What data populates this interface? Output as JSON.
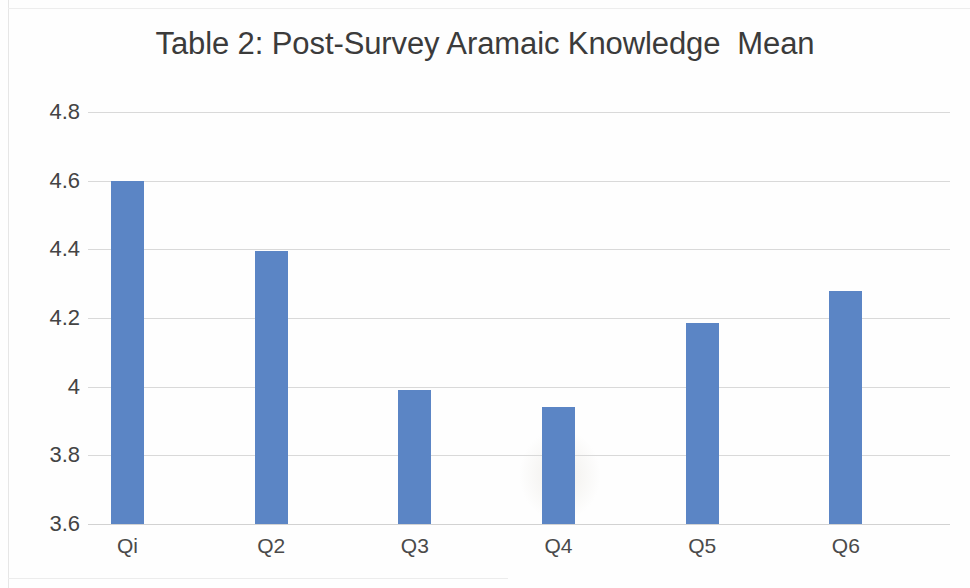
{
  "chart_data": {
    "type": "bar",
    "title": "Table 2: Post-Survey Aramaic Knowledge  Mean",
    "xlabel": "",
    "ylabel": "",
    "categories": [
      "Qi",
      "Q2",
      "Q3",
      "Q4",
      "Q5",
      "Q6"
    ],
    "values": [
      4.6,
      4.395,
      3.99,
      3.94,
      4.185,
      4.28
    ],
    "ylim": [
      3.6,
      4.8
    ],
    "ytick_labels": [
      "4.8",
      "4.6",
      "4.4",
      "4.2",
      "4",
      "3.8",
      "3.6"
    ],
    "ytick_values": [
      4.8,
      4.6,
      4.4,
      4.2,
      4.0,
      3.8,
      3.6
    ],
    "grid": true,
    "legend": false,
    "legend_position": "none",
    "series": [
      {
        "name": "Mean",
        "values": [
          4.6,
          4.395,
          3.99,
          3.94,
          4.185,
          4.28
        ]
      }
    ],
    "colors": {
      "bar": "#5b85c5",
      "gridline": "#d9d9d9",
      "title_text": "#3b3b3b",
      "tick_text": "#444444",
      "background": "#fefefe"
    }
  }
}
